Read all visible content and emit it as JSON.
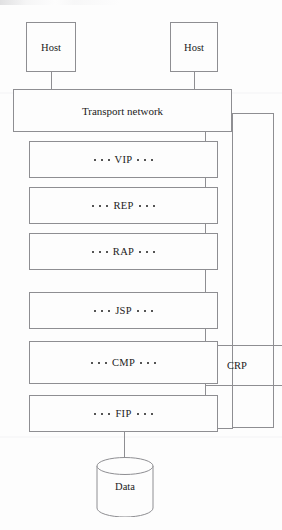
{
  "diagram": {
    "background_color": "#fdfdfd",
    "line_color": "#8e8e92",
    "text_color": "#1b1b1b",
    "hosts": [
      {
        "label": "Host"
      },
      {
        "label": "Host"
      }
    ],
    "transport": {
      "label": "Transport network"
    },
    "layers": [
      {
        "label": "VIP",
        "dots_left": 3,
        "dots_right": 3
      },
      {
        "label": "REP",
        "dots_left": 3,
        "dots_right": 3
      },
      {
        "label": "RAP",
        "dots_left": 3,
        "dots_right": 3
      },
      {
        "label": "JSP",
        "dots_left": 3,
        "dots_right": 3
      },
      {
        "label": "CMP",
        "dots_left": 3,
        "dots_right": 3
      },
      {
        "label": "FIP",
        "dots_left": 3,
        "dots_right": 3
      }
    ],
    "side_block": {
      "label": "CRP"
    },
    "datastore": {
      "label": "Data"
    }
  }
}
